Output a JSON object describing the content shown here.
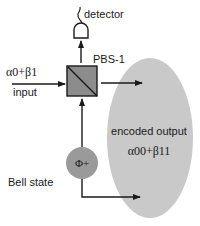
{
  "diagram": {
    "labels": {
      "detector": "detector",
      "pbs": "PBS-1",
      "input_state": "α0+β1",
      "input": "input",
      "bell_symbol": "Φ+",
      "bell_state": "Bell state",
      "output_title": "encoded output",
      "output_state": "α00+β11"
    },
    "colors": {
      "ellipse": "#c9c9c9",
      "pbs_fill": "#8c8c8c",
      "bell_fill": "#9a9a9a",
      "line": "#1a1a1a",
      "text": "#1a1a1a"
    }
  }
}
